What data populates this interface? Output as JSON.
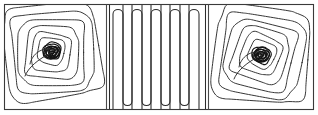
{
  "figure": {
    "title": "",
    "background_color": "#ffffff",
    "frame_color": "#3a3a3a",
    "contour_color": "#2b2b2b",
    "core_color": "#141414",
    "width_px": 318,
    "height_px": 115
  },
  "chart_data": {
    "type": "line",
    "title": "",
    "subtitle": "",
    "xlabel": "",
    "ylabel": "",
    "grid": false,
    "legend": null,
    "plot_kind": "contour-streamline-field",
    "panel_count": 3,
    "frame": {
      "x": 4.5,
      "y": 4.5,
      "width": 309,
      "height": 105
    },
    "dividers": [
      {
        "name": "divider-left",
        "x": 106.5,
        "y0": 4.5,
        "y1": 109.5
      },
      {
        "name": "divider-right",
        "x": 208.5,
        "y0": 4.5,
        "y1": 109.5
      }
    ],
    "panels": [
      {
        "name": "left-vortex-panel",
        "kind": "spiral-vortex",
        "bounds": {
          "x0": 5,
          "y0": 5,
          "x1": 106,
          "y1": 109
        },
        "center": {
          "x": 52,
          "y": 52
        },
        "contour_count": 9,
        "rotation_deg": -8,
        "spiral_tail": true,
        "ring_radii_x": [
          47,
          40,
          33,
          26,
          19,
          13,
          8,
          5,
          3
        ],
        "ring_radii_y": [
          47,
          40,
          33,
          26,
          19,
          13,
          8,
          5,
          3
        ],
        "corner_roundness": [
          0.3,
          0.34,
          0.4,
          0.48,
          0.58,
          0.7,
          0.85,
          0.95,
          1.0
        ]
      },
      {
        "name": "middle-serpentine-panel",
        "kind": "serpentine-hairpins",
        "bounds": {
          "x0": 108,
          "y0": 5,
          "x1": 207,
          "y1": 109
        },
        "line_count": 10,
        "hairpin_pairs": 5,
        "x_positions": [
          113,
          123,
          132,
          142,
          151,
          161,
          170,
          180,
          189,
          199
        ],
        "top_y": 9,
        "bottom_y": 106,
        "turn_radius": 5,
        "turn_at_top": [
          false,
          true,
          false,
          true,
          false,
          true,
          false,
          true,
          false,
          true
        ]
      },
      {
        "name": "right-vortex-panel",
        "kind": "spiral-vortex",
        "bounds": {
          "x0": 210,
          "y0": 5,
          "x1": 313,
          "y1": 109
        },
        "center": {
          "x": 261,
          "y": 55
        },
        "contour_count": 9,
        "rotation_deg": 6,
        "spiral_tail": true,
        "ring_radii_x": [
          47,
          40,
          33,
          26,
          19,
          13,
          8,
          5,
          3
        ],
        "ring_radii_y": [
          47,
          40,
          33,
          26,
          19,
          13,
          8,
          5,
          3
        ],
        "corner_roundness": [
          0.3,
          0.34,
          0.4,
          0.48,
          0.58,
          0.7,
          0.85,
          0.95,
          1.0
        ]
      }
    ]
  }
}
